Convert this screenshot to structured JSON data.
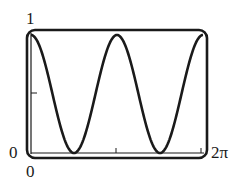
{
  "chart_data": {
    "type": "line",
    "title": "",
    "xlabel": "",
    "ylabel": "",
    "function": "cos^2(x)",
    "xlim": [
      0,
      6.2832
    ],
    "ylim": [
      0,
      1
    ],
    "x_tick_labels": [
      "0",
      "2π"
    ],
    "y_tick_labels": [
      "0",
      "1"
    ],
    "grid": false,
    "legend": null,
    "series": [
      {
        "name": "y = cos²(x)",
        "x": [
          0,
          0.7854,
          1.5708,
          2.3562,
          3.1416,
          3.927,
          4.7124,
          5.4978,
          6.2832
        ],
        "values": [
          1,
          0.5,
          0,
          0.5,
          1,
          0.5,
          0,
          0.5,
          1
        ]
      }
    ]
  },
  "labels": {
    "y_max": "1",
    "y_min": "0",
    "x_min": "0",
    "x_max": "2π"
  },
  "colors": {
    "curve": "#1a1a1a",
    "frame": "#1a1a1a",
    "background": "#ffffff"
  }
}
